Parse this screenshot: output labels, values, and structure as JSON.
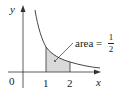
{
  "diagram": {
    "type": "area-under-curve",
    "function": "y = 1/x^2",
    "axes": {
      "x_label": "x",
      "y_label": "y",
      "origin_label": "0",
      "x_ticks": [
        "1",
        "2"
      ]
    },
    "shaded_region": {
      "from": 1,
      "to": 2
    },
    "annotation": {
      "text": "area =",
      "fraction_numerator": "1",
      "fraction_denominator": "2"
    },
    "colors": {
      "axis": "#333333",
      "curve": "#333333",
      "shade": "#d9d9d9"
    }
  }
}
